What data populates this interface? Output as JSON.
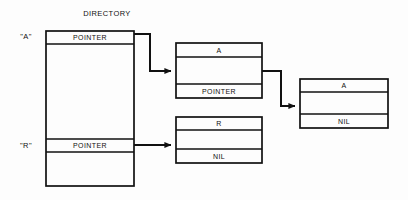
{
  "diagram": {
    "title": "DIRECTORY",
    "stroke_color": "#111111",
    "background_color": "#fdfdfd",
    "directory": {
      "name": "DIRECTORY",
      "entries": [
        {
          "key": "\"A\"",
          "slot_label": "POINTER"
        },
        {
          "key": "\"R\"",
          "slot_label": "POINTER"
        }
      ]
    },
    "nodes": [
      {
        "id": "node-a-1",
        "header": "A",
        "middle": "",
        "footer": "POINTER"
      },
      {
        "id": "node-a-2",
        "header": "A",
        "middle": "",
        "footer": "NIL"
      },
      {
        "id": "node-r-1",
        "header": "R",
        "middle": "",
        "footer": "NIL"
      }
    ],
    "connectors": [
      {
        "id": "connector-a-to-node-a-1",
        "from": "directory-entry-a",
        "to": "node-a-1",
        "style": "stepped"
      },
      {
        "id": "connector-node-a-1-to-node-a-2",
        "from": "node-a-1",
        "to": "node-a-2",
        "style": "stepped"
      },
      {
        "id": "connector-r-to-node-r-1",
        "from": "directory-entry-r",
        "to": "node-r-1",
        "style": "straight"
      }
    ]
  }
}
